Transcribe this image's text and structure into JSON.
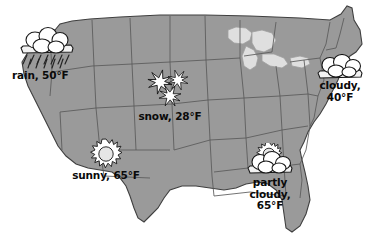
{
  "map": {
    "title": "United States weather map",
    "region_fill": "#9a9a9a",
    "lakes_fill": "#dcdcdc",
    "border_color": "#4a4a4a",
    "background": "#ffffff"
  },
  "weather_markers": [
    {
      "id": "rain",
      "icon": "rain-cloud-icon",
      "condition": "rain",
      "temperature": "50°F",
      "label": "rain, 50°F",
      "region": "Pacific Northwest"
    },
    {
      "id": "snow",
      "icon": "snowflake-icon",
      "condition": "snow",
      "temperature": "28°F",
      "label": "snow, 28°F",
      "region": "Great Plains"
    },
    {
      "id": "sunny",
      "icon": "sun-icon",
      "condition": "sunny",
      "temperature": "65°F",
      "label": "sunny, 65°F",
      "region": "Southwest"
    },
    {
      "id": "cloudy",
      "icon": "cloud-icon",
      "condition": "cloudy",
      "temperature": "40°F",
      "label": "cloudy,\n40°F",
      "region": "Northeast"
    },
    {
      "id": "partly-cloudy",
      "icon": "sun-behind-cloud-icon",
      "condition": "partly cloudy",
      "temperature": "65°F",
      "label": "partly\ncloudy,\n65°F",
      "region": "Southeast"
    }
  ]
}
